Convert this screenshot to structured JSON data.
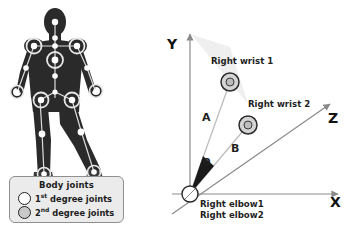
{
  "figure": {
    "left_panel": {
      "name": "body-silhouette-with-joints",
      "legend": {
        "title": "Body joints",
        "items": [
          {
            "label_main": "1",
            "label_ordinal": "st",
            "label_rest": " degree joints",
            "swatch": "hollow-circle",
            "color": "#ffffff"
          },
          {
            "label_main": "2",
            "label_ordinal": "nd",
            "label_rest": " degree joints",
            "swatch": "gray-circle",
            "color": "#c9c9c9"
          }
        ]
      },
      "joint_markers": {
        "first_degree_label": "1st degree joints",
        "second_degree_label": "2nd degree joints"
      }
    },
    "right_panel": {
      "name": "3d-axis-angle-diagram",
      "axes": [
        {
          "name": "y-axis",
          "label": "Y"
        },
        {
          "name": "x-axis",
          "label": "X"
        },
        {
          "name": "z-axis",
          "label": "Z"
        }
      ],
      "points": [
        {
          "name": "right-wrist-1",
          "label": "Right wrist 1"
        },
        {
          "name": "right-wrist-2",
          "label": "Right wrist 2"
        },
        {
          "name": "right-elbow-1",
          "label": "Right elbow1"
        },
        {
          "name": "right-elbow-2",
          "label": "Right elbow2"
        }
      ],
      "vectors": [
        {
          "name": "vector-a",
          "label": "A"
        },
        {
          "name": "vector-b",
          "label": "B"
        }
      ],
      "angle": {
        "name": "theta-angle",
        "label": "θ"
      },
      "colors": {
        "axis": "#8a8a8a",
        "wedge_fill": "#efefef",
        "angle_wedge": "#1a1a1a",
        "marker_fill": "#d4d4d4",
        "marker_stroke": "#2b2b2b",
        "text": "#1f1f1f"
      }
    }
  }
}
